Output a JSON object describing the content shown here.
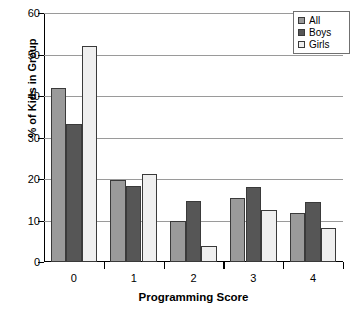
{
  "chart_data": {
    "type": "bar",
    "title": "",
    "xlabel": "Programming Score",
    "ylabel": "% of Kids in Group",
    "categories": [
      "0",
      "1",
      "2",
      "3",
      "4"
    ],
    "series": [
      {
        "name": "All",
        "color": "#9a9a9a",
        "values": [
          42.0,
          19.8,
          9.8,
          15.5,
          11.7
        ]
      },
      {
        "name": "Boys",
        "color": "#565656",
        "values": [
          33.2,
          18.2,
          14.7,
          18.0,
          14.5
        ]
      },
      {
        "name": "Girls",
        "color": "#efefef",
        "values": [
          52.1,
          21.3,
          3.9,
          12.6,
          8.2
        ]
      }
    ],
    "ylim": [
      0,
      60
    ],
    "yticks": [
      0,
      10,
      20,
      30,
      40,
      50,
      60
    ],
    "ytick_labels": [
      "0",
      "10",
      "20",
      "30",
      "40",
      "50",
      "60"
    ],
    "grid": true,
    "grid_axis": "y",
    "legend_position": "top-right",
    "bar_border_color": "#3a3a3a",
    "axis_color": "#000000",
    "gridline_color": "#9a9a9a",
    "background": "#ffffff"
  },
  "legend": {
    "items": [
      {
        "label": "All"
      },
      {
        "label": "Boys"
      },
      {
        "label": "Girls"
      }
    ]
  }
}
